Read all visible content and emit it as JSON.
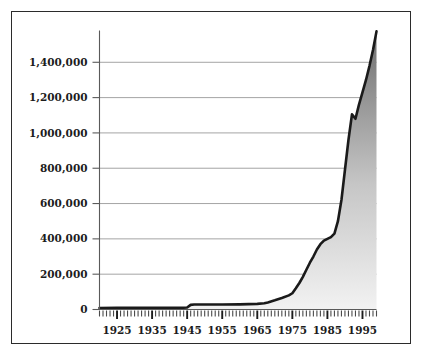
{
  "chart_data": {
    "type": "area",
    "title": "",
    "subtitle": "",
    "xlabel": "",
    "ylabel": "",
    "xlim": [
      1920,
      1999
    ],
    "ylim": [
      0,
      1580000
    ],
    "grid": true,
    "legend": null,
    "y_ticks": [
      0,
      200000,
      400000,
      600000,
      800000,
      1000000,
      1200000,
      1400000
    ],
    "y_tick_labels": [
      "0",
      "200,000",
      "400,000",
      "600,000",
      "800,000",
      "1,000,000",
      "1,200,000",
      "1,400,000"
    ],
    "x_ticks": [
      1925,
      1935,
      1945,
      1955,
      1965,
      1975,
      1985,
      1995
    ],
    "x_tick_labels": [
      "1925",
      "1935",
      "1945",
      "1955",
      "1965",
      "1975",
      "1985",
      "1995"
    ],
    "x_minor_tick_step": 1,
    "series": [
      {
        "name": "series-1",
        "x": [
          1920,
          1925,
          1930,
          1935,
          1940,
          1944,
          1945,
          1946,
          1947,
          1950,
          1955,
          1960,
          1965,
          1967,
          1968,
          1970,
          1972,
          1974,
          1975,
          1976,
          1977,
          1978,
          1979,
          1980,
          1981,
          1982,
          1983,
          1984,
          1985,
          1986,
          1987,
          1988,
          1989,
          1990,
          1991,
          1992,
          1993,
          1994,
          1995,
          1996,
          1997,
          1998,
          1999
        ],
        "values": [
          8000,
          9000,
          10000,
          10000,
          10000,
          10000,
          11000,
          26000,
          28000,
          28000,
          28000,
          29000,
          32000,
          35000,
          40000,
          52000,
          65000,
          80000,
          92000,
          120000,
          150000,
          185000,
          225000,
          265000,
          300000,
          340000,
          370000,
          390000,
          400000,
          410000,
          430000,
          500000,
          620000,
          790000,
          960000,
          1105000,
          1080000,
          1160000,
          1230000,
          1300000,
          1380000,
          1470000,
          1575000
        ]
      }
    ],
    "colors": {
      "line": "#1a1a1a",
      "fill_top": "#6e6e6e",
      "fill_bottom": "#f2f2f2",
      "grid": "#9a9a9a",
      "axis": "#5a5a5a",
      "frame": "#2b2b2b",
      "text": "#1c1c1c"
    }
  }
}
